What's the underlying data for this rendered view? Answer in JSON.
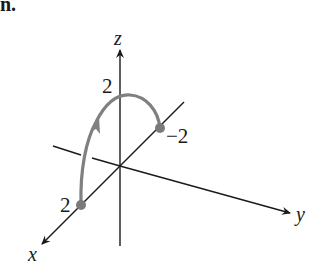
{
  "figure": {
    "heading_fragment": "n.",
    "axes": {
      "x_label": "x",
      "y_label": "y",
      "z_label": "z"
    },
    "tick_labels": {
      "x_point": "2",
      "z_point": "2",
      "y_point": "−2"
    },
    "colors": {
      "axis": "#1a1a1a",
      "curve": "#808080",
      "point": "#7a7a7a",
      "background": "#ffffff"
    },
    "curve": {
      "description": "Semicircular arc from (x=2) on the x-axis, rising through z=2, ending at y=-2, with a direction arrow",
      "start_point": "x=2",
      "apex": "z=2",
      "end_point": "y=-2"
    }
  }
}
